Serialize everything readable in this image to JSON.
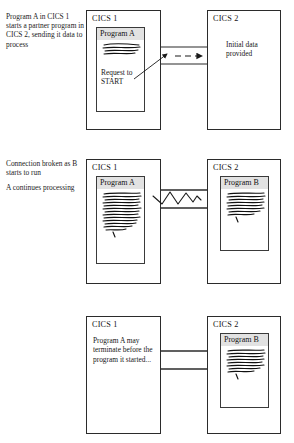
{
  "diagram": {
    "line_color": "#2b2b2b",
    "label_band_color": "#e2e2e2"
  },
  "panels": [
    {
      "id": "panel-start",
      "caption": [
        "Program A in CICS 1 starts a partner program in CICS 2, sending it data to process"
      ],
      "left_system": {
        "label": "CICS 1",
        "program": {
          "label": "Program A",
          "note": "Request to START",
          "has_code_scribble": true
        }
      },
      "right_system": {
        "label": "CICS 2",
        "program": null,
        "annotation": "Initial data provided"
      },
      "link": {
        "type": "channel",
        "arrow": "dashed-right",
        "broken": false
      }
    },
    {
      "id": "panel-broken",
      "caption": [
        "Connection broken as B starts to run",
        "A continues processing"
      ],
      "left_system": {
        "label": "CICS 1",
        "program": {
          "label": "Program A",
          "note": "",
          "has_code_scribble": true
        }
      },
      "right_system": {
        "label": "CICS 2",
        "program": {
          "label": "Program B",
          "note": "",
          "has_code_scribble": true
        },
        "annotation": ""
      },
      "link": {
        "type": "channel",
        "arrow": "none",
        "broken": true
      }
    },
    {
      "id": "panel-terminate",
      "caption": [],
      "left_system": {
        "label": "CICS 1",
        "program": null,
        "inner_text": "Program A may terminate before the program it started..."
      },
      "right_system": {
        "label": "CICS 2",
        "program": {
          "label": "Program B",
          "note": "",
          "has_code_scribble": true
        },
        "annotation": ""
      },
      "link": {
        "type": "channel",
        "arrow": "none",
        "broken": false
      }
    }
  ]
}
